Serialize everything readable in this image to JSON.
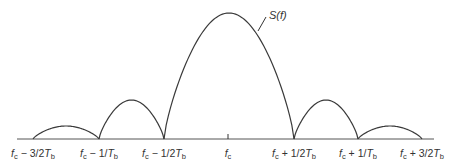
{
  "figure": {
    "curve_label": {
      "base": "S",
      "arg": "(f)"
    },
    "axis_labels": [
      {
        "sym": "f",
        "sub": "c",
        "op": " − 3/2",
        "T": "T",
        "Tsub": "b",
        "x": 33
      },
      {
        "sym": "f",
        "sub": "c",
        "op": " − 1/",
        "T": "T",
        "Tsub": "b",
        "x": 99
      },
      {
        "sym": "f",
        "sub": "c",
        "op": " − 1/2",
        "T": "T",
        "Tsub": "b",
        "x": 164
      },
      {
        "sym": "f",
        "sub": "c",
        "op": "",
        "T": "",
        "Tsub": "",
        "x": 228
      },
      {
        "sym": "f",
        "sub": "c",
        "op": " + 1/2",
        "T": "T",
        "Tsub": "b",
        "x": 294
      },
      {
        "sym": "f",
        "sub": "c",
        "op": " + 1/",
        "T": "T",
        "Tsub": "b",
        "x": 358
      },
      {
        "sym": "f",
        "sub": "c",
        "op": " + 3/2",
        "T": "T",
        "Tsub": "b",
        "x": 422
      }
    ],
    "lobes": [
      {
        "name": "second-left-sidelobe",
        "x0": 33,
        "x1": 99,
        "peak_y": 126
      },
      {
        "name": "first-left-sidelobe",
        "x0": 99,
        "x1": 164,
        "peak_y": 100
      },
      {
        "name": "main-lobe",
        "x0": 164,
        "x1": 294,
        "peak_y": 13
      },
      {
        "name": "first-right-sidelobe",
        "x0": 294,
        "x1": 358,
        "peak_y": 100
      },
      {
        "name": "second-right-sidelobe",
        "x0": 358,
        "x1": 422,
        "peak_y": 126
      }
    ],
    "axis": {
      "x0": 17,
      "x1": 434,
      "y": 139
    },
    "center_tick_x": 228
  }
}
